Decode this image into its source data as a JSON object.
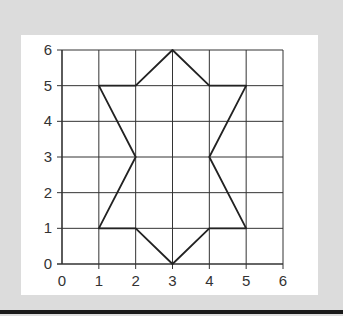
{
  "chart_data": {
    "type": "line",
    "title": "",
    "xlabel": "",
    "ylabel": "",
    "xlim": [
      0,
      6
    ],
    "ylim": [
      0,
      6
    ],
    "grid": true,
    "x_ticks": [
      "0",
      "1",
      "2",
      "3",
      "4",
      "5",
      "6"
    ],
    "y_ticks": [
      "0",
      "1",
      "2",
      "3",
      "4",
      "5",
      "6"
    ],
    "series": [
      {
        "name": "polygon",
        "closed": true,
        "points": [
          [
            1,
            5
          ],
          [
            2,
            5
          ],
          [
            3,
            6
          ],
          [
            4,
            5
          ],
          [
            5,
            5
          ],
          [
            4,
            3
          ],
          [
            5,
            1
          ],
          [
            4,
            1
          ],
          [
            3,
            0
          ],
          [
            2,
            1
          ],
          [
            1,
            1
          ],
          [
            2,
            3
          ],
          [
            1,
            5
          ]
        ]
      }
    ]
  },
  "colors": {
    "background": "#dcdcdc",
    "panel": "#ffffff",
    "grid": "#333333",
    "shape": "#222222"
  }
}
